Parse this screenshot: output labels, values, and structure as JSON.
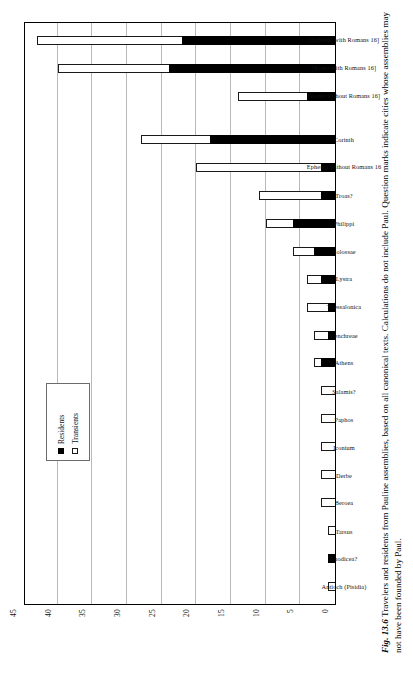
{
  "figure": {
    "fig_number": "Fig. 13.6",
    "caption": " Travelers and residents from Pauline assemblies, based on all canonical texts. Calculations do not include Paul. Question marks indicate cities whose assemblies may not have been founded by Paul."
  },
  "legend": {
    "position": "inside-top-left",
    "items": [
      {
        "label": "Residents",
        "swatch": "filled-square-icon",
        "color": "#000000"
      },
      {
        "label": "Transients",
        "swatch": "hollow-square-icon",
        "color": "#ffffff"
      }
    ]
  },
  "chart_data": {
    "type": "bar",
    "orientation": "vertical-stacked",
    "title": "",
    "xlabel": "",
    "ylabel": "",
    "ylim": [
      0,
      45
    ],
    "yticks": [
      0,
      5,
      10,
      15,
      20,
      25,
      30,
      35,
      40,
      45
    ],
    "grid": true,
    "categories": [
      "Antioch (Pisidia)",
      "Laodicea?",
      "Tarsus",
      "Beroea",
      "Derbe",
      "Iconium",
      "Paphos",
      "Salamis?",
      "Athens",
      "Cenchreae",
      "Thessalonica",
      "Lystra",
      "Colossae",
      "Philippi",
      "Troas?",
      "Ephesus without Romans 16",
      "Corinth",
      "",
      "[Rome without Romans 16]",
      "[Rome with Romans 16]",
      "[Ephesus with Romans 16]"
    ],
    "series": [
      {
        "name": "Residents",
        "color": "#000000",
        "values": [
          0,
          1,
          0,
          0,
          0,
          0,
          0,
          0,
          2,
          1,
          1,
          2,
          3,
          6,
          2,
          2,
          18,
          0,
          4,
          24,
          22
        ]
      },
      {
        "name": "Transients",
        "color": "#ffffff",
        "values": [
          1,
          0,
          1,
          2,
          2,
          2,
          2,
          2,
          1,
          2,
          3,
          2,
          3,
          4,
          9,
          18,
          10,
          0,
          10,
          16,
          21
        ]
      }
    ],
    "totals": [
      1,
      1,
      1,
      2,
      2,
      2,
      2,
      2,
      3,
      3,
      4,
      4,
      6,
      10,
      11,
      20,
      28,
      0,
      14,
      40,
      43
    ]
  }
}
